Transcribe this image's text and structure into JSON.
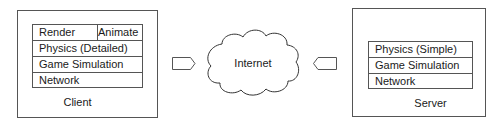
{
  "client": {
    "label": "Client",
    "layers": [
      {
        "left": "Render",
        "right": "Animate"
      },
      {
        "label": "Physics (Detailed)"
      },
      {
        "label": "Game Simulation"
      },
      {
        "label": "Network"
      }
    ]
  },
  "internet": {
    "label": "Internet"
  },
  "server": {
    "label": "Server",
    "layers": [
      {
        "label": "Physics (Simple)"
      },
      {
        "label": "Game Simulation"
      },
      {
        "label": "Network"
      }
    ]
  },
  "arrows": [
    {
      "from": "client",
      "to": "internet",
      "direction": "right"
    },
    {
      "from": "server",
      "to": "internet",
      "direction": "left"
    }
  ]
}
